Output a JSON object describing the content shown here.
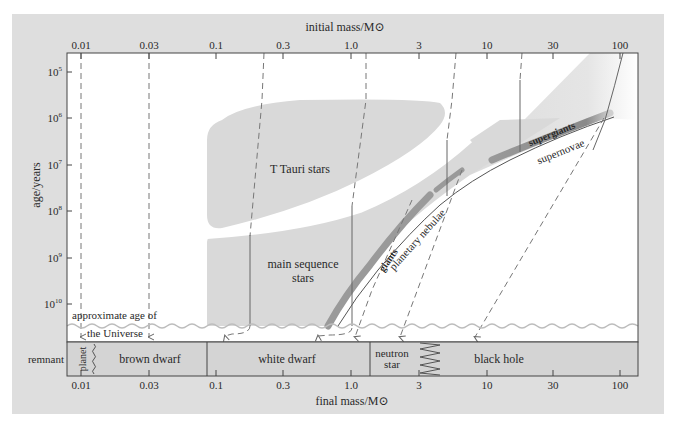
{
  "figure": {
    "top_axis_title": "initial mass/M⊙",
    "bottom_axis_title": "final mass/M⊙",
    "left_axis_title": "age/years",
    "top_ticks": [
      "0.01",
      "0.03",
      "0.1",
      "0.3",
      "1.0",
      "3",
      "10",
      "30",
      "100"
    ],
    "bottom_ticks": [
      "0.01",
      "0.03",
      "0.1",
      "0.3",
      "1.0",
      "3",
      "10",
      "30",
      "100"
    ],
    "age_ticks": [
      {
        "base": "10",
        "exp": "5"
      },
      {
        "base": "10",
        "exp": "6"
      },
      {
        "base": "10",
        "exp": "7"
      },
      {
        "base": "10",
        "exp": "8"
      },
      {
        "base": "10",
        "exp": "9"
      },
      {
        "base": "10",
        "exp": "10"
      }
    ],
    "regions": {
      "t_tauri": "T Tauri stars",
      "main_sequence_line1": "main sequence",
      "main_sequence_line2": "stars",
      "giants": "giants",
      "planetary_nebulae": "planetary nebulae",
      "supergiants": "supergiants",
      "supernovae": "supernovae",
      "universe_age_line1": "approximate age of",
      "universe_age_line2": "the Universe"
    },
    "remnant_row": {
      "label": "remnant",
      "planet": "planet",
      "brown_dwarf": "brown dwarf",
      "white_dwarf": "white dwarf",
      "neutron_star_line1": "neutron",
      "neutron_star_line2": "star",
      "black_hole": "black hole"
    },
    "colors": {
      "panel_bg": "#dedede",
      "plot_bg": "#ffffff",
      "region_fill": "#d9d9d9",
      "giant_band": "#9a9a9a",
      "remnant_fill": "#d4d4d4",
      "line": "#555555",
      "wave": "#bdbdbd"
    }
  }
}
